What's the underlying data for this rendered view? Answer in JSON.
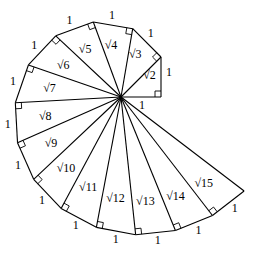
{
  "diagram": {
    "center": [
      121,
      97
    ],
    "unit_px": 40,
    "stroke_color": "#000000",
    "background": "#ffffff",
    "triangles": 14,
    "side_label": "1",
    "hypotenuse_labels": [
      "√2",
      "√3",
      "√4",
      "√5",
      "√6",
      "√7",
      "√8",
      "√9",
      "√10",
      "√11",
      "√12",
      "√13",
      "√14",
      "√15"
    ],
    "right_angle_markers": true
  }
}
